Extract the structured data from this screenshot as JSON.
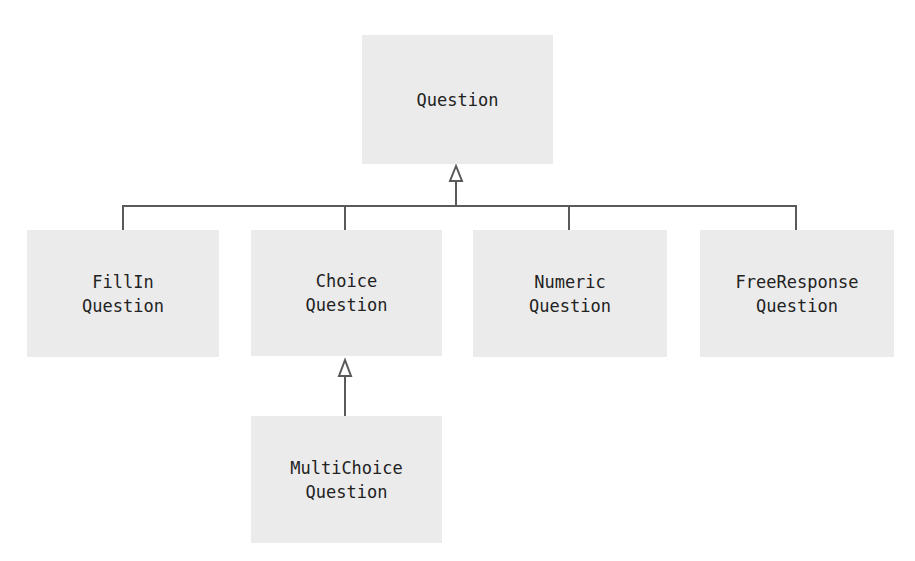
{
  "diagram": {
    "type": "uml-class-hierarchy",
    "colors": {
      "box_fill": "#ebebeb",
      "line": "#5a5a5a",
      "text": "#222222",
      "background": "#ffffff"
    },
    "nodes": {
      "question": {
        "line1": "Question",
        "line2": ""
      },
      "fillin": {
        "line1": "FillIn",
        "line2": "Question"
      },
      "choice": {
        "line1": "Choice",
        "line2": "Question"
      },
      "numeric": {
        "line1": "Numeric",
        "line2": "Question"
      },
      "freeresponse": {
        "line1": "FreeResponse",
        "line2": "Question"
      },
      "multichoice": {
        "line1": "MultiChoice",
        "line2": "Question"
      }
    },
    "edges": [
      {
        "from": "FillInQuestion",
        "to": "Question",
        "type": "inheritance"
      },
      {
        "from": "ChoiceQuestion",
        "to": "Question",
        "type": "inheritance"
      },
      {
        "from": "NumericQuestion",
        "to": "Question",
        "type": "inheritance"
      },
      {
        "from": "FreeResponseQuestion",
        "to": "Question",
        "type": "inheritance"
      },
      {
        "from": "MultiChoiceQuestion",
        "to": "ChoiceQuestion",
        "type": "inheritance"
      }
    ]
  }
}
